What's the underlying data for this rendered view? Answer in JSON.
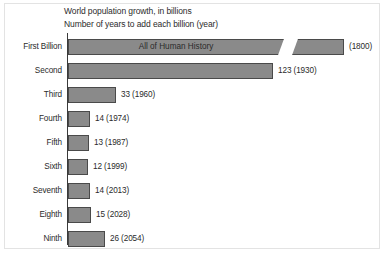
{
  "titles": [
    "World population growth, in billions",
    "Number of years to add each billion (year)"
  ],
  "colors": {
    "bar_fill": "#8a8a8a",
    "bar_border": "#4a4a4a",
    "axis": "#3a3a3a",
    "text": "#2b2b2b",
    "frame": "#e3e3e3"
  },
  "chart_data": {
    "type": "bar",
    "title": "World population growth, in billions",
    "subtitle": "Number of years to add each billion (year)",
    "xlabel": "",
    "ylabel": "",
    "orientation": "horizontal",
    "grid": false,
    "legend": null,
    "axis_break": true,
    "categories": [
      "First Billion",
      "Second",
      "Third",
      "Fourth",
      "Fifth",
      "Sixth",
      "Seventh",
      "Eighth",
      "Ninth"
    ],
    "values": [
      null,
      123,
      33,
      14,
      13,
      12,
      14,
      15,
      26
    ],
    "years": [
      1800,
      1930,
      1960,
      1974,
      1987,
      1999,
      2013,
      2028,
      2054
    ],
    "value_labels": [
      "(1800)",
      "123 (1930)",
      "33 (1960)",
      "14 (1974)",
      "13 (1987)",
      "12 (1999)",
      "14 (2013)",
      "15 (2028)",
      "26 (2054)"
    ],
    "bar_inner_label": "All of Human History"
  },
  "rows": [
    {
      "label": "First Billion",
      "value_label": "(1800)",
      "inner_label": "All of Human History",
      "bar_px": 276,
      "top": 2
    },
    {
      "label": "Second",
      "value_label": "123 (1930)",
      "bar_px": 205,
      "top": 26
    },
    {
      "label": "Third",
      "value_label": "33 (1960)",
      "bar_px": 48,
      "top": 50
    },
    {
      "label": "Fourth",
      "value_label": "14 (1974)",
      "bar_px": 22,
      "top": 74
    },
    {
      "label": "Fifth",
      "value_label": "13 (1987)",
      "bar_px": 21,
      "top": 98
    },
    {
      "label": "Sixth",
      "value_label": "12 (1999)",
      "bar_px": 20,
      "top": 122
    },
    {
      "label": "Seventh",
      "value_label": "14 (2013)",
      "bar_px": 22,
      "top": 146
    },
    {
      "label": "Eighth",
      "value_label": "15 (2028)",
      "bar_px": 23,
      "top": 170
    },
    {
      "label": "Ninth",
      "value_label": "26 (2054)",
      "bar_px": 37,
      "top": 194
    }
  ]
}
